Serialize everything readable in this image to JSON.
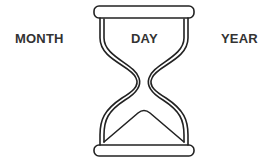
{
  "labels": {
    "month": "MONTH",
    "day": "DAY",
    "year": "YEAR"
  },
  "icon": {
    "name": "hourglass-icon",
    "stroke_color": "#222222"
  },
  "colors": {
    "text": "#333333",
    "background": "#ffffff"
  }
}
